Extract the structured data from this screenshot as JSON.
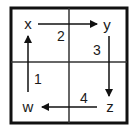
{
  "diagram": {
    "type": "cycle-grid",
    "colors": {
      "stroke": "#111111",
      "text": "#1a1a1a",
      "background": "#ffffff"
    },
    "nodes": [
      {
        "id": "x",
        "label": "x",
        "position": "top-left"
      },
      {
        "id": "y",
        "label": "y",
        "position": "top-right"
      },
      {
        "id": "z",
        "label": "z",
        "position": "bottom-right"
      },
      {
        "id": "w",
        "label": "w",
        "position": "bottom-left"
      }
    ],
    "edges": [
      {
        "from": "x",
        "to": "y",
        "label": "2",
        "direction": "right"
      },
      {
        "from": "y",
        "to": "z",
        "label": "3",
        "direction": "down"
      },
      {
        "from": "z",
        "to": "w",
        "label": "4",
        "direction": "left"
      },
      {
        "from": "w",
        "to": "x",
        "label": "1",
        "direction": "up"
      }
    ]
  }
}
